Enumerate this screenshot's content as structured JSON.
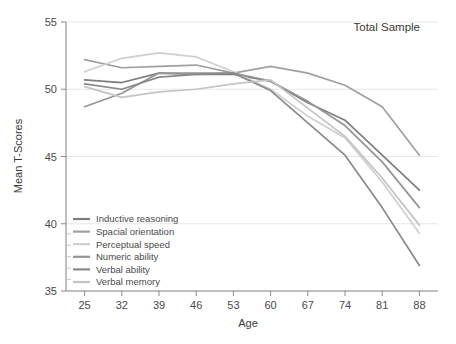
{
  "chart_data": {
    "type": "line",
    "title": "Total Sample",
    "xlabel": "Age",
    "ylabel": "Mean T-Scores",
    "x": [
      25,
      32,
      39,
      46,
      53,
      60,
      67,
      74,
      81,
      88
    ],
    "xlim": [
      21.5,
      91.5
    ],
    "ylim": [
      35,
      55
    ],
    "yticks": [
      35,
      40,
      45,
      50,
      55
    ],
    "xticks": [
      25,
      32,
      39,
      46,
      53,
      60,
      67,
      74,
      81,
      88
    ],
    "grid": "horizontal",
    "legend_position": "lower-left",
    "series": [
      {
        "name": "Inductive reasoning",
        "color": "#7d7d7d",
        "values": [
          50.7,
          50.5,
          51.2,
          51.1,
          51.1,
          50.6,
          49.0,
          47.7,
          45.1,
          42.5
        ]
      },
      {
        "name": "Spacial orientation",
        "color": "#a0a0a0",
        "values": [
          52.2,
          51.6,
          51.7,
          51.8,
          51.2,
          51.7,
          51.2,
          50.3,
          48.7,
          45.1
        ]
      },
      {
        "name": "Perceptual speed",
        "color": "#cfcfcf",
        "values": [
          51.3,
          52.3,
          52.7,
          52.4,
          51.3,
          50.0,
          48.0,
          46.4,
          43.1,
          39.3
        ]
      },
      {
        "name": "Numeric ability",
        "color": "#949494",
        "values": [
          48.7,
          49.7,
          51.2,
          51.2,
          51.2,
          50.6,
          49.1,
          47.3,
          44.6,
          41.2
        ]
      },
      {
        "name": "Verbal ability",
        "color": "#8a8a8a",
        "values": [
          50.4,
          50.0,
          50.9,
          51.1,
          51.2,
          49.9,
          47.5,
          45.1,
          41.2,
          36.9
        ]
      },
      {
        "name": "Verbal memory",
        "color": "#c4c4c4",
        "values": [
          50.2,
          49.4,
          49.8,
          50.0,
          50.4,
          50.7,
          48.6,
          46.5,
          43.4,
          39.9
        ]
      }
    ]
  },
  "legend": {
    "items": [
      {
        "label": "Inductive reasoning",
        "color": "#7d7d7d"
      },
      {
        "label": "Spacial orientation",
        "color": "#a0a0a0"
      },
      {
        "label": "Perceptual speed",
        "color": "#cfcfcf"
      },
      {
        "label": "Numeric ability",
        "color": "#949494"
      },
      {
        "label": "Verbal ability",
        "color": "#8a8a8a"
      },
      {
        "label": "Verbal memory",
        "color": "#c4c4c4"
      }
    ]
  },
  "axes": {
    "y_title": "Mean T-Scores",
    "x_title": "Age",
    "y_tick_labels": [
      "35",
      "40",
      "45",
      "50",
      "55"
    ],
    "x_tick_labels": [
      "25",
      "32",
      "39",
      "46",
      "53",
      "60",
      "67",
      "74",
      "81",
      "88"
    ]
  },
  "panel": {
    "title": "Total Sample"
  }
}
